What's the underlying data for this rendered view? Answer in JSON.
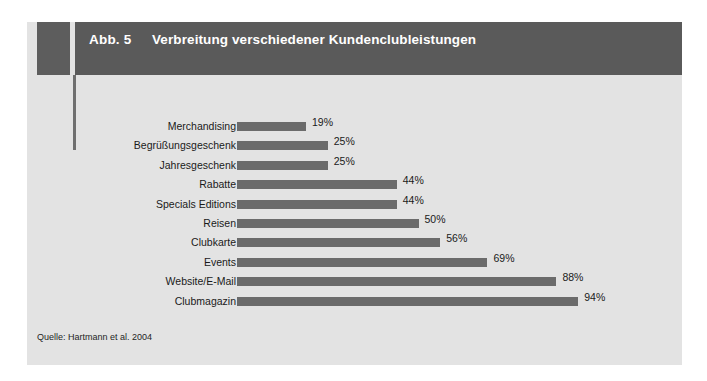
{
  "figure": {
    "number_label": "Abb. 5",
    "title": "Verbreitung verschiedener Kundenclubleistungen",
    "source": "Quelle: Hartmann et al. 2004"
  },
  "colors": {
    "page_background": "#ffffff",
    "panel_background": "#e3e3e3",
    "title_bar": "#5a5a5a",
    "corner_block": "#5d5d5d",
    "accent_rule": "#6f6f6f",
    "bar": "#6b6b6b",
    "title_text": "#ffffff",
    "body_text": "#1a1a1a"
  },
  "chart_data": {
    "type": "bar",
    "orientation": "horizontal",
    "title": "Verbreitung verschiedener Kundenclubleistungen",
    "xlabel": "",
    "ylabel": "",
    "xlim": [
      0,
      100
    ],
    "grid": false,
    "legend": false,
    "value_suffix": "%",
    "categories": [
      "Merchandising",
      "Begrüßungsgeschenk",
      "Jahresgeschenk",
      "Rabatte",
      "Specials Editions",
      "Reisen",
      "Clubkarte",
      "Events",
      "Website/E-Mail",
      "Clubmagazin"
    ],
    "values": [
      19,
      25,
      25,
      44,
      44,
      50,
      56,
      69,
      88,
      94
    ],
    "value_labels": [
      "19%",
      "25%",
      "25%",
      "44%",
      "44%",
      "50%",
      "56%",
      "69%",
      "88%",
      "94%"
    ]
  }
}
